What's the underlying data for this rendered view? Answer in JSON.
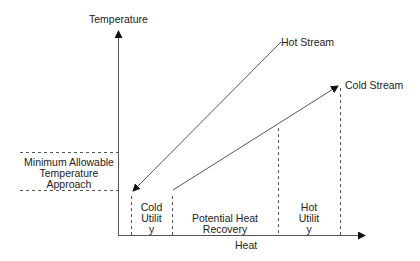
{
  "diagram": {
    "y_axis_label": "Temperature",
    "x_axis_label": "Heat",
    "hot_stream_label": "Hot Stream",
    "cold_stream_label": "Cold Stream",
    "min_approach_label_line1": "Minimum Allowable",
    "min_approach_label_line2": "Temperature",
    "min_approach_label_line3": "Approach",
    "cold_utility_line1": "Cold",
    "cold_utility_line2": "Utilit",
    "cold_utility_line3": "y",
    "heat_recovery_line1": "Potential Heat",
    "heat_recovery_line2": "Recovery",
    "hot_utility_line1": "Hot",
    "hot_utility_line2": "Utilit",
    "hot_utility_line3": "y",
    "colors": {
      "line": "#555555",
      "text": "#222222",
      "background": "#ffffff"
    }
  }
}
